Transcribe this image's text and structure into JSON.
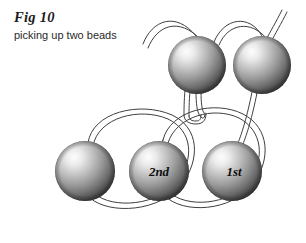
{
  "figure": {
    "title": "Fig 10",
    "subtitle": "picking up two beads",
    "background_color": "#ffffff",
    "thread_color": "#3a3a3a",
    "bead_highlight_color": "#f2f2f2",
    "bead_mid_color": "#a8a8a8",
    "bead_shadow_color": "#3c3c3c",
    "label_color": "#0d0d0d"
  },
  "beads": [
    {
      "id": "lower-left-bead",
      "label": "",
      "row": "lower",
      "cx": 85,
      "cy": 171,
      "r": 30
    },
    {
      "id": "lower-middle-bead",
      "label": "2nd",
      "row": "lower",
      "cx": 159,
      "cy": 171,
      "r": 30
    },
    {
      "id": "lower-right-bead",
      "label": "1st",
      "row": "lower",
      "cx": 232,
      "cy": 171,
      "r": 30
    },
    {
      "id": "upper-left-bead",
      "label": "",
      "row": "upper",
      "cx": 197,
      "cy": 65,
      "r": 29
    },
    {
      "id": "upper-right-bead",
      "label": "",
      "row": "upper",
      "cx": 262,
      "cy": 65,
      "r": 29
    }
  ],
  "threads": {
    "upper_loop_left_label": "thread-arc-to-upper-left-bead",
    "upper_loop_right_label": "thread-arc-between-upper-beads",
    "needle_loop_label": "thread-hook-loop",
    "lower_loop_left_label": "thread-loop-left",
    "lower_loop_right_label": "thread-loop-right",
    "descending_thread_label": "thread-from-upper-right-bead"
  }
}
